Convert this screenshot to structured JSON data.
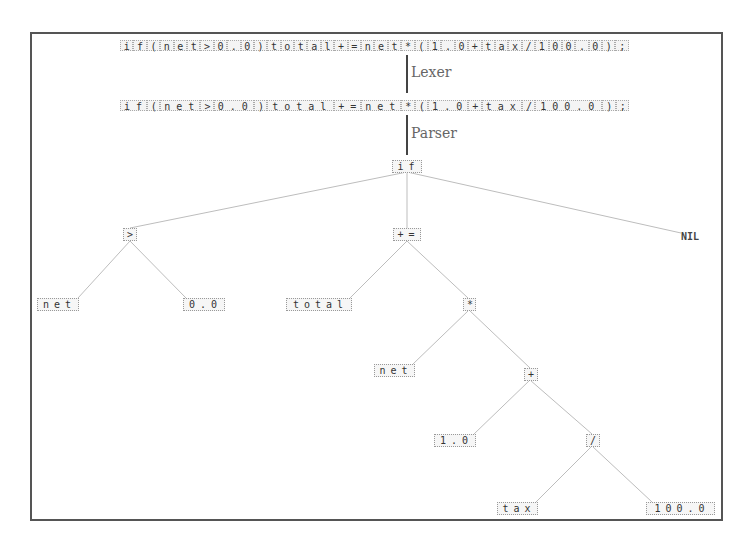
{
  "diagram": {
    "source_chars": [
      "i",
      "f",
      "(",
      "n",
      "e",
      "t",
      ">",
      "0",
      ".",
      "0",
      ")",
      "t",
      "o",
      "t",
      "a",
      "l",
      "+",
      "=",
      "n",
      "e",
      "t",
      "*",
      "(",
      "1",
      ".",
      "0",
      "+",
      "t",
      "a",
      "x",
      "/",
      "1",
      "0",
      "0",
      ".",
      "0",
      ")",
      ";"
    ],
    "tokens": [
      "if",
      "(",
      "net",
      ">",
      "0.0",
      ")",
      "total",
      "+=",
      "net",
      "*",
      "(",
      "1.0",
      "+",
      "tax",
      "/",
      "100.0",
      ")",
      ";"
    ],
    "stages": {
      "lexer": "Lexer",
      "parser": "Parser"
    },
    "tree": {
      "root": "if",
      "nodes": {
        "cond": ">",
        "cond_left": "net",
        "cond_right": "0.0",
        "then": "+=",
        "then_left": "total",
        "then_right": "*",
        "mul_left": "net",
        "mul_right": "+",
        "add_left": "1.0",
        "add_right": "/",
        "div_left": "tax",
        "div_right": "100.0",
        "else": "NIL"
      }
    },
    "colors": {
      "border": "#555555",
      "edge": "#bbbbbb",
      "cell_bg": "#f4f4f4",
      "arrow": "#444444"
    }
  }
}
